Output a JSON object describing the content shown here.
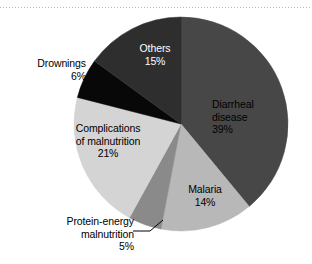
{
  "figure": {
    "background_color": "#ffffff",
    "rule": {
      "name": "dotted-rule",
      "style": "dotted",
      "color": "#b9b9b9"
    }
  },
  "chart_data": {
    "type": "pie",
    "title": "",
    "subtitle": "",
    "xlabel": "",
    "ylabel": "",
    "legend_position": "none",
    "labels_inside": true,
    "start_angle_deg": 0,
    "direction": "clockwise",
    "categories": [
      "Diarrheal disease",
      "Malaria",
      "Protein-energy malnutrition",
      "Complications of malnutrition",
      "Drownings",
      "Others"
    ],
    "values": [
      39,
      14,
      5,
      21,
      6,
      15
    ],
    "value_labels": [
      "39%",
      "14%",
      "5%",
      "21%",
      "6%",
      "15%"
    ],
    "colors": [
      "#474747",
      "#b8b8b8",
      "#8a8a8a",
      "#d4d4d4",
      "#080808",
      "#2e2e2e"
    ],
    "slices": [
      {
        "name": "Diarrheal disease",
        "label_line1": "Diarrheal",
        "label_line2": "disease",
        "percent": 39,
        "percent_label": "39%",
        "color": "#474747",
        "text_color": "#000000",
        "label_placement": "inside",
        "start_deg": 0,
        "end_deg": 140.4
      },
      {
        "name": "Malaria",
        "label_line1": "Malaria",
        "label_line2": "",
        "percent": 14,
        "percent_label": "14%",
        "color": "#b8b8b8",
        "text_color": "#000000",
        "label_placement": "inside",
        "start_deg": 140.4,
        "end_deg": 190.8
      },
      {
        "name": "Protein-energy malnutrition",
        "label_line1": "Protein-energy",
        "label_line2": "malnutrition",
        "percent": 5,
        "percent_label": "5%",
        "color": "#8a8a8a",
        "text_color": "#000000",
        "label_placement": "outside-leader",
        "start_deg": 190.8,
        "end_deg": 208.8
      },
      {
        "name": "Complications of malnutrition",
        "label_line1": "Complications",
        "label_line2": "of malnutrition",
        "percent": 21,
        "percent_label": "21%",
        "color": "#d4d4d4",
        "text_color": "#000000",
        "label_placement": "inside",
        "start_deg": 208.8,
        "end_deg": 284.4
      },
      {
        "name": "Drownings",
        "label_line1": "Drownings",
        "label_line2": "",
        "percent": 6,
        "percent_label": "6%",
        "color": "#080808",
        "text_color": "#000000",
        "label_placement": "outside",
        "start_deg": 284.4,
        "end_deg": 306.0
      },
      {
        "name": "Others",
        "label_line1": "Others",
        "label_line2": "",
        "percent": 15,
        "percent_label": "15%",
        "color": "#2e2e2e",
        "text_color": "#ffffff",
        "label_placement": "inside",
        "start_deg": 306.0,
        "end_deg": 360.0
      }
    ]
  }
}
